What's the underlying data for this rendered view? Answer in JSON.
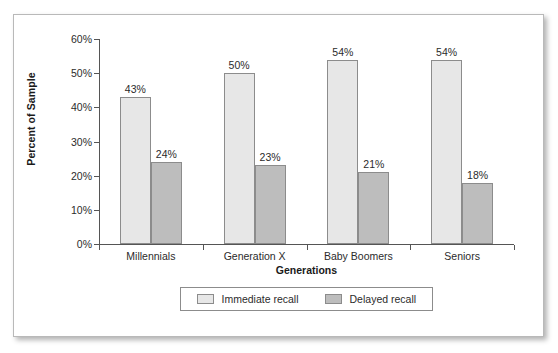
{
  "chart_data": {
    "type": "bar",
    "title": "",
    "xlabel": "Generations",
    "ylabel": "Percent of Sample",
    "categories": [
      "Millennials",
      "Generation X",
      "Baby Boomers",
      "Seniors"
    ],
    "series": [
      {
        "name": "Immediate recall",
        "values": [
          43,
          50,
          54,
          54
        ],
        "labels": [
          "43%",
          "50%",
          "54%",
          "54%"
        ],
        "color": "#e7e7e7"
      },
      {
        "name": "Delayed recall",
        "values": [
          24,
          23,
          21,
          18
        ],
        "labels": [
          "24%",
          "23%",
          "21%",
          "18%"
        ],
        "color": "#bdbdbd"
      }
    ],
    "ylim": [
      0,
      60
    ],
    "yticks": [
      0,
      10,
      20,
      30,
      40,
      50,
      60
    ],
    "ytick_labels": [
      "0%",
      "10%",
      "20%",
      "30%",
      "40%",
      "50%",
      "60%"
    ],
    "grid": false,
    "legend_position": "bottom-center",
    "value_labels_shown": true,
    "units": "percent"
  },
  "legend": {
    "entries": [
      {
        "label": "Immediate recall"
      },
      {
        "label": "Delayed recall"
      }
    ]
  }
}
